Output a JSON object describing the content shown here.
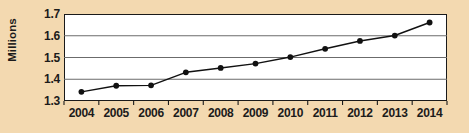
{
  "chart_data": {
    "type": "line",
    "title": "",
    "xlabel": "",
    "ylabel": "Millions",
    "categories": [
      "2004",
      "2005",
      "2006",
      "2007",
      "2008",
      "2009",
      "2010",
      "2011",
      "2012",
      "2013",
      "2014"
    ],
    "values": [
      1.342,
      1.37,
      1.372,
      1.432,
      1.452,
      1.472,
      1.502,
      1.54,
      1.576,
      1.601,
      1.661
    ],
    "series": [
      {
        "name": "Millions",
        "values": [
          1.342,
          1.37,
          1.372,
          1.432,
          1.452,
          1.472,
          1.502,
          1.54,
          1.576,
          1.601,
          1.661
        ]
      }
    ],
    "ylim": [
      1.3,
      1.7
    ],
    "yticks": [
      1.3,
      1.4,
      1.5,
      1.6,
      1.7
    ],
    "ytick_labels": [
      "1.3",
      "1.4",
      "1.5",
      "1.6",
      "1.7"
    ],
    "xtick_labels": [
      "2004",
      "2005",
      "2006",
      "2007",
      "2008",
      "2009",
      "2010",
      "2011",
      "2012",
      "2013",
      "2014"
    ],
    "grid": true,
    "grid_axis": "y",
    "legend": false,
    "legend_position": "none",
    "marker": "circle",
    "annotations": []
  },
  "colors": {
    "background": "#f3d9b0",
    "plot_background": "#ffffff",
    "line": "#111111",
    "marker": "#111111",
    "gridline": "#6b6b6b",
    "axis": "#1a1a1a",
    "text": "#1b1b1b"
  },
  "axis": {
    "y_title": "Millions",
    "y_ticks": [
      "1.7",
      "1.6",
      "1.5",
      "1.4",
      "1.3"
    ],
    "x_ticks": [
      "2004",
      "2005",
      "2006",
      "2007",
      "2008",
      "2009",
      "2010",
      "2011",
      "2012",
      "2013",
      "2014"
    ]
  },
  "title": ""
}
